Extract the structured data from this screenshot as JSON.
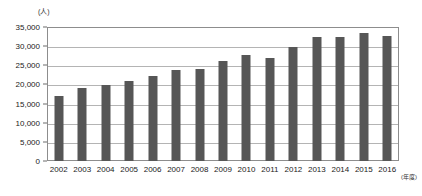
{
  "chart_data": {
    "type": "bar",
    "title": "",
    "xlabel": "(年度)",
    "ylabel": "(人)",
    "unit_y": "(人)",
    "unit_x": "(年度)",
    "categories": [
      "2002",
      "2003",
      "2004",
      "2005",
      "2006",
      "2007",
      "2008",
      "2009",
      "2010",
      "2011",
      "2012",
      "2013",
      "2014",
      "2015",
      "2016"
    ],
    "values": [
      17100,
      19200,
      19800,
      20800,
      22200,
      23700,
      24000,
      26000,
      27800,
      26800,
      29800,
      32400,
      32300,
      33500,
      32600
    ],
    "ylim": [
      0,
      35000
    ],
    "yticks": [
      0,
      5000,
      10000,
      15000,
      20000,
      25000,
      30000,
      35000
    ],
    "ytick_labels": [
      "0",
      "5,000",
      "10,000",
      "15,000",
      "20,000",
      "25,000",
      "30,000",
      "35,000"
    ],
    "grid": true,
    "legend": "none",
    "bar_color": "#565656",
    "grid_color": "#b4b4b4",
    "axis_color": "#8d8d8d"
  }
}
